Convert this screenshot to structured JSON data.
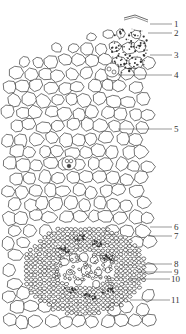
{
  "figure": {
    "header_text_faint": [
      "",
      ""
    ],
    "callouts": [
      {
        "num": "1",
        "target": "epidermis/cuticle"
      },
      {
        "num": "2",
        "target": "outer cortex"
      },
      {
        "num": "3",
        "target": "stippled (sclerenchyma/collenchyma) cells"
      },
      {
        "num": "4",
        "target": "cell with inclusions"
      },
      {
        "num": "5",
        "target": "ground parenchyma"
      },
      {
        "num": "6",
        "target": "bundle sheath"
      },
      {
        "num": "7",
        "target": "phloem fibers"
      },
      {
        "num": "8",
        "target": "phloem"
      },
      {
        "num": "9",
        "target": "xylem vessel"
      },
      {
        "num": "10",
        "target": "cambium"
      },
      {
        "num": "11",
        "target": "xylem"
      }
    ]
  },
  "colors": {
    "line": "#3a3a3a",
    "background": "#ffffff",
    "label": "#333333"
  }
}
